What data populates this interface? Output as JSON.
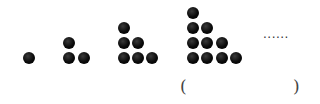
{
  "figure": {
    "groups": [
      {
        "id": 1,
        "count": 1,
        "rows": [
          1
        ]
      },
      {
        "id": 2,
        "count": 3,
        "rows": [
          1,
          2
        ]
      },
      {
        "id": 3,
        "count": 6,
        "rows": [
          1,
          2,
          3
        ]
      },
      {
        "id": 4,
        "count": 10,
        "rows": [
          1,
          2,
          3,
          4
        ]
      }
    ],
    "continuation": "......",
    "answer_blank": {
      "open": "(",
      "close": ")"
    }
  }
}
